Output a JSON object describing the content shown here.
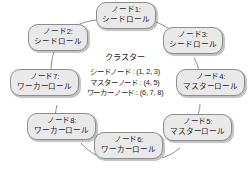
{
  "diagram": {
    "type": "cluster-ring-topology",
    "background_color": "#ffffff",
    "node_fill_color": "#e9e9e9",
    "node_border_color": "#8d8d8d",
    "text_color": "#1c1c1c",
    "cluster": {
      "title": "クラスター",
      "lines": [
        "シードノード : (1, 2, 3)",
        "マスターノード : (4, 5)",
        "ワーカーノード : (6, 7, 8)"
      ]
    },
    "nodes": [
      {
        "id": "node-1",
        "label": "ノード1:",
        "role": "シードロール"
      },
      {
        "id": "node-2",
        "label": "ノード2:",
        "role": "シードロール"
      },
      {
        "id": "node-3",
        "label": "ノード3:",
        "role": "シードロール"
      },
      {
        "id": "node-4",
        "label": "ノード4:",
        "role": "マスターロール"
      },
      {
        "id": "node-5",
        "label": "ノード5:",
        "role": "マスターロール"
      },
      {
        "id": "node-6",
        "label": "ノード6:",
        "role": "ワーカーロール"
      },
      {
        "id": "node-7",
        "label": "ノード7:",
        "role": "ワーカーロール"
      },
      {
        "id": "node-8",
        "label": "ノード8:",
        "role": "ワーカーロール"
      }
    ]
  }
}
